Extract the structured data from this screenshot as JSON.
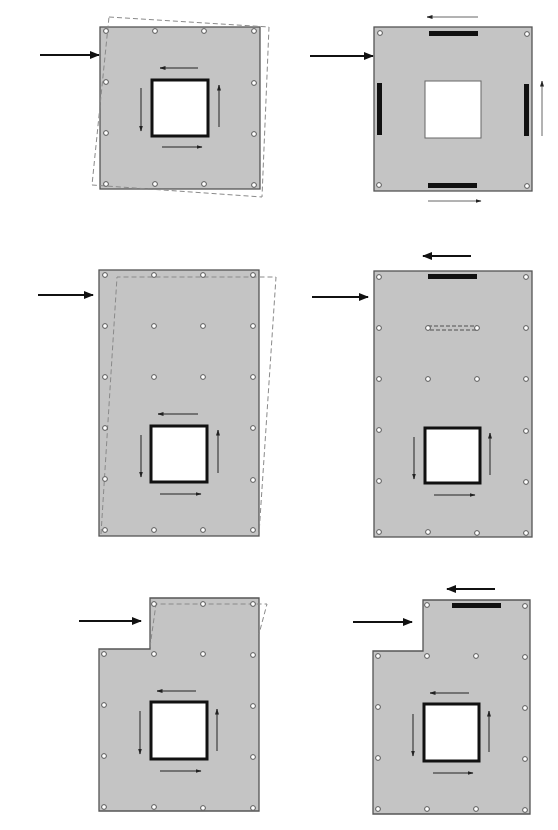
{
  "figure": {
    "colors": {
      "plate_fill": "#c4c4c4",
      "plate_stroke": "#555555",
      "bar": "#111111",
      "dashed_outline": "#8a8a8a",
      "background": "#ffffff"
    },
    "panels": [
      {
        "id": "a",
        "position": "top-left",
        "shape": "square plate",
        "opening": "square, thick border",
        "features": [
          "applied load arrow (left)",
          "rotated dashed outline",
          "shear flow arrows around opening",
          "12 bolt holes"
        ]
      },
      {
        "id": "b",
        "position": "top-right",
        "shape": "square plate",
        "opening": "square, thin border",
        "features": [
          "applied load arrow (left)",
          "four black edge bars",
          "reaction arrows top/right/bottom",
          "4 corner bolt holes"
        ]
      },
      {
        "id": "c",
        "position": "middle-left",
        "shape": "tall rectangular plate",
        "opening": "square, thick border, lower portion",
        "features": [
          "applied load arrow (left)",
          "sheared dashed outline",
          "shear flow arrows around opening",
          "bolt grid 4x6"
        ]
      },
      {
        "id": "d",
        "position": "middle-right",
        "shape": "tall rectangular plate",
        "opening": "square, thick border, lower portion",
        "features": [
          "applied load arrow (left)",
          "top black collector bar",
          "reaction arrow above",
          "dashed internal strut",
          "shear flow arrows",
          "bolt grid"
        ]
      },
      {
        "id": "e",
        "position": "bottom-left",
        "shape": "L-shaped (stepped) plate",
        "opening": "square, thick border",
        "features": [
          "applied load arrow at step",
          "sheared dashed outline on upper part",
          "shear flow arrows",
          "bolt holes"
        ]
      },
      {
        "id": "f",
        "position": "bottom-right",
        "shape": "L-shaped (stepped) plate",
        "opening": "square, thick border",
        "features": [
          "applied load arrow at step",
          "top black collector bar",
          "reaction arrow above",
          "shear flow arrows",
          "bolt holes"
        ]
      }
    ],
    "caption_partial": "(caption cut off at bottom edge)"
  }
}
